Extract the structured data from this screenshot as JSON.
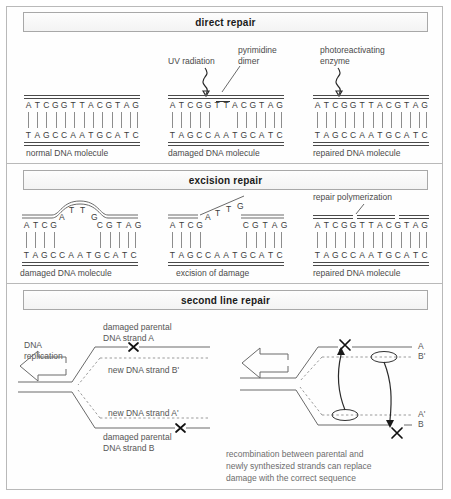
{
  "panels": [
    {
      "id": "direct-repair",
      "header": "direct repair",
      "molecules": [
        {
          "name": "normal-dna",
          "top_sequence": "ATCGGTTACGTAG",
          "bottom_sequence": "TAGCCAATGCATC",
          "caption": "normal DNA molecule"
        },
        {
          "name": "damaged-dna",
          "top_sequence": "ATCGGTTACGTAG",
          "bottom_sequence": "TAGCCAATGCATC",
          "caption": "damaged DNA molecule"
        },
        {
          "name": "repaired-dna",
          "top_sequence": "ATCGGTTACGTAG",
          "bottom_sequence": "TAGCCAATGCATC",
          "caption": "repaired DNA molecule"
        }
      ],
      "annotations": [
        {
          "name": "uv-radiation",
          "text": "UV radiation"
        },
        {
          "name": "pyrimidine-dimer",
          "line1": "pyrimidine",
          "line2": "dimer"
        },
        {
          "name": "photoreactivating-enzyme",
          "line1": "photoreactivating",
          "line2": "enzyme"
        }
      ]
    },
    {
      "id": "excision-repair",
      "header": "excision repair",
      "molecules": [
        {
          "name": "damaged-dna-excision",
          "top_left_sequence": "ATCG",
          "bulge_sequence": "ATTG",
          "top_right_sequence": "CGTAG",
          "bottom_sequence": "TAGCCAATGCATC",
          "caption": "damaged DNA molecule"
        },
        {
          "name": "excised-dna",
          "top_left_sequence": "ATCG",
          "excised_sequence": "ATTG",
          "top_right_sequence": "CGTAG",
          "bottom_sequence": "TAGCCAATGCATC",
          "caption": "excision of damage"
        },
        {
          "name": "repaired-dna-excision",
          "top_sequence": "ATCGGTTACGTAG",
          "bottom_sequence": "TAGCCAATGCATC",
          "caption": "repaired DNA molecule"
        }
      ],
      "annotations": [
        {
          "name": "repair-polymerization",
          "text": "repair polymerization"
        }
      ]
    },
    {
      "id": "second-line-repair",
      "header": "second line repair",
      "left_diagram": {
        "name": "replication-fork",
        "replication_label_line1": "DNA",
        "replication_label_line2": "replication",
        "strand_a_line1": "damaged parental",
        "strand_a_line2": "DNA strand A",
        "strand_b_prime": "new DNA strand B'",
        "strand_a_prime": "new DNA strand A'",
        "strand_b_line1": "damaged parental",
        "strand_b_line2": "DNA strand B"
      },
      "right_diagram": {
        "name": "recombination-fork",
        "label_a": "A",
        "label_b_prime": "B'",
        "label_a_prime": "A'",
        "label_b": "B",
        "caption_line1": "recombination between parental and",
        "caption_line2": "newly synthesized strands can replace",
        "caption_line3": "damage with the correct sequence"
      }
    }
  ],
  "colors": {
    "frame": "#b9b9b9",
    "header_border": "#a8a8a8",
    "text": "#4a4a4a",
    "strand": "#6a6a6a",
    "strand_dark": "#2a2a2a"
  }
}
